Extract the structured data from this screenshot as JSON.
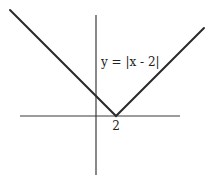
{
  "chart_data": {
    "type": "line",
    "title": "",
    "equation_label": "y = |x - 2|",
    "xlabel": "",
    "ylabel": "",
    "tick_labels": [
      {
        "x": 2,
        "label": "2"
      }
    ],
    "vertex": {
      "x": 2,
      "y": 0
    },
    "series": [
      {
        "name": "y = |x - 2|",
        "points": [
          [
            -8.6,
            10.6
          ],
          [
            2,
            0
          ],
          [
            10.8,
            8.8
          ]
        ]
      }
    ],
    "x_range": [
      -7.6,
      8.4
    ],
    "y_range": [
      -5.9,
      10.1
    ],
    "grid": false,
    "legend": "none"
  }
}
